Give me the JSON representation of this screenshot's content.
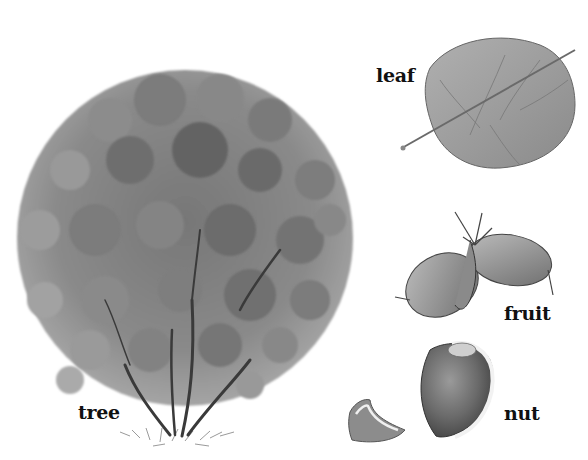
{
  "illustration": {
    "subject": "hazel plant parts",
    "background": "#ffffff",
    "palette": {
      "foliage_light": "#a8a8a8",
      "foliage_mid": "#7d7d7d",
      "foliage_dark": "#5a5a5a",
      "trunk": "#3a3a3a",
      "leaf_fill": "#9a9a9a",
      "nut_fill": "#6e6e6e",
      "outline": "#444444"
    },
    "labels": {
      "tree": "tree",
      "leaf": "leaf",
      "fruit": "fruit",
      "nut": "nut"
    }
  }
}
